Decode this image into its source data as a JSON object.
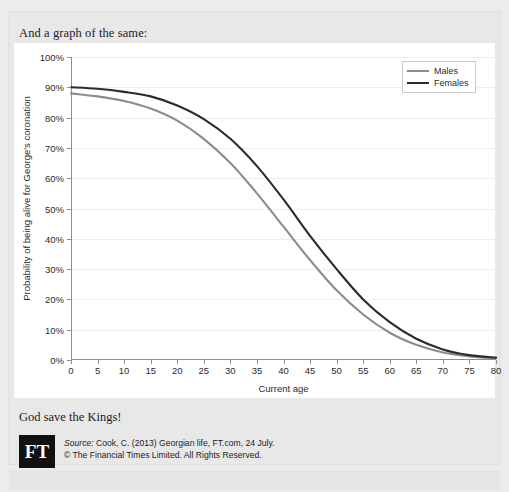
{
  "card": {
    "heading": "And a graph of the same:",
    "closing_line": "God save the Kings!"
  },
  "legend": {
    "position": "top-right",
    "items": [
      {
        "label": "Males",
        "color": "#8c8c8c"
      },
      {
        "label": "Females",
        "color": "#2b2b2b"
      }
    ]
  },
  "source": {
    "logo_text": "FT",
    "line1": "Source: Cook, C. (2013) Georgian life, FT.com, 24 July.",
    "line1_prefix": "Source:",
    "line1_rest": " Cook, C. (2013) Georgian life, FT.com, 24 July.",
    "line2": "© The Financial Times Limited. All Rights Reserved."
  },
  "chart_data": {
    "type": "line",
    "title": "",
    "xlabel": "Current age",
    "ylabel": "Probability of being alive for George's coronation",
    "xlim": [
      0,
      80
    ],
    "ylim": [
      0,
      100
    ],
    "grid": true,
    "legend_position": "top-right",
    "x_ticks": [
      0,
      5,
      10,
      15,
      20,
      25,
      30,
      35,
      40,
      45,
      50,
      55,
      60,
      65,
      70,
      75,
      80
    ],
    "x_tick_labels": [
      "0",
      "5",
      "10",
      "15",
      "20",
      "25",
      "30",
      "35",
      "40",
      "45",
      "50",
      "55",
      "60",
      "65",
      "70",
      "75",
      "80"
    ],
    "y_ticks": [
      0,
      10,
      20,
      30,
      40,
      50,
      60,
      70,
      80,
      90,
      100
    ],
    "y_tick_labels": [
      "0%",
      "10%",
      "20%",
      "30%",
      "40%",
      "50%",
      "60%",
      "70%",
      "80%",
      "90%",
      "100%"
    ],
    "x": [
      0,
      5,
      10,
      15,
      20,
      25,
      30,
      35,
      40,
      45,
      50,
      55,
      60,
      65,
      70,
      75,
      80
    ],
    "series": [
      {
        "name": "Males",
        "color": "#8c8c8c",
        "values": [
          88,
          87,
          85.5,
          83,
          79,
          73,
          65,
          55,
          44,
          33,
          23,
          15,
          9,
          5,
          2.5,
          1.2,
          0.6
        ]
      },
      {
        "name": "Females",
        "color": "#2b2b2b",
        "values": [
          90,
          89.5,
          88.5,
          87,
          84,
          79.5,
          73,
          64,
          53,
          41,
          30,
          20,
          12.5,
          7,
          3.5,
          1.6,
          0.8
        ]
      }
    ]
  }
}
